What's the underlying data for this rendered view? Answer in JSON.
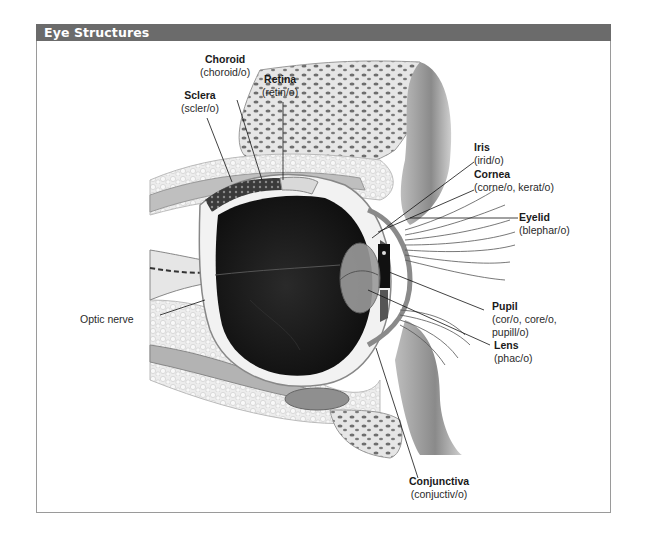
{
  "figure": {
    "title": "Eye Structures",
    "header_color": "#6b6b6b"
  },
  "labels": {
    "choroid": {
      "term": "Choroid",
      "root": "(choroid/o)"
    },
    "retina": {
      "term": "Retina",
      "root": "(retin/o)"
    },
    "sclera": {
      "term": "Sclera",
      "root": "(scler/o)"
    },
    "iris": {
      "term": "Iris",
      "root": "(irid/o)"
    },
    "cornea": {
      "term": "Cornea",
      "root": "(corne/o, kerat/o)"
    },
    "eyelid": {
      "term": "Eyelid",
      "root": "(blephar/o)"
    },
    "pupil": {
      "term": "Pupil",
      "root_line1": "(cor/o, core/o,",
      "root_line2": "pupill/o)"
    },
    "lens": {
      "term": "Lens",
      "root": "(phac/o)"
    },
    "optic_nerve": {
      "term": "Optic nerve"
    },
    "conjunctiva": {
      "term": "Conjunctiva",
      "root": "(conjuctiv/o)"
    }
  }
}
